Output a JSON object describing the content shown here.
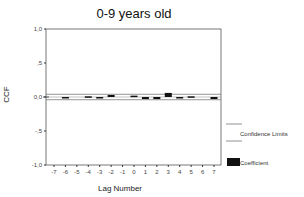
{
  "chart_data": {
    "type": "bar",
    "title": "0-9 years old",
    "xlabel": "Lag Number",
    "ylabel": "CCF",
    "ylim": [
      -1.0,
      1.0
    ],
    "yticks": [
      "1,0",
      ",5",
      "0,0",
      "-,5",
      "-1,0"
    ],
    "ytick_values": [
      1.0,
      0.5,
      0.0,
      -0.5,
      -1.0
    ],
    "categories": [
      "-7",
      "-6",
      "-5",
      "-4",
      "-3",
      "-2",
      "-1",
      "0",
      "1",
      "2",
      "3",
      "4",
      "5",
      "6",
      "7"
    ],
    "series": [
      {
        "name": "Coefficient",
        "values": [
          0.0,
          -0.02,
          0.0,
          0.01,
          -0.01,
          0.03,
          0.0,
          0.02,
          -0.03,
          -0.03,
          0.06,
          -0.01,
          0.01,
          0.0,
          -0.03
        ]
      }
    ],
    "confidence_limits": {
      "upper": 0.04,
      "lower": -0.04
    },
    "legend": [
      {
        "label": "Confidence Limits",
        "type": "line"
      },
      {
        "label": "Coefficient",
        "type": "bar"
      }
    ],
    "legend_position": "right",
    "grid": false
  },
  "colors": {
    "bar": "#111111",
    "axis": "#555555",
    "confidence": "#777777"
  }
}
